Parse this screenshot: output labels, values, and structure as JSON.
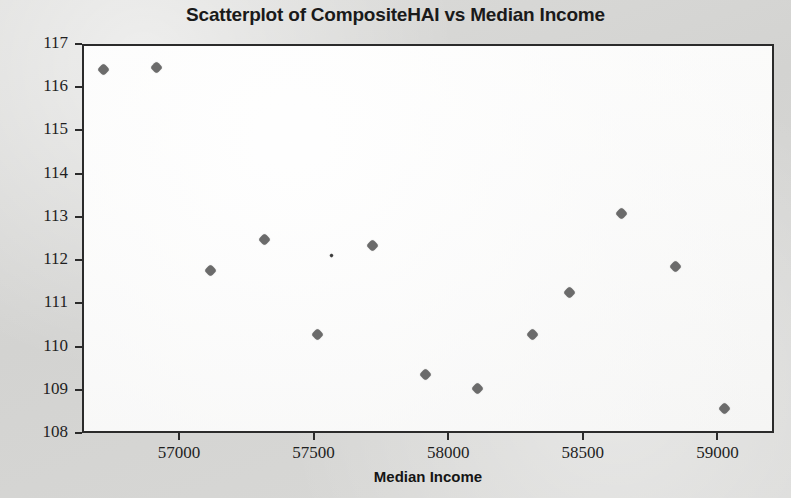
{
  "chart_data": {
    "type": "scatter",
    "title": "Scatterplot of CompositeHAI vs Median Income",
    "xlabel": "Median Income",
    "ylabel": "CompositeHAI",
    "xlim": [
      56640,
      59210
    ],
    "ylim": [
      108,
      117
    ],
    "xticks": [
      57000,
      57500,
      58000,
      58500,
      59000
    ],
    "xtick_labels": [
      "57000",
      "57500",
      "58000",
      "58500",
      "59000"
    ],
    "yticks": [
      108,
      109,
      110,
      111,
      112,
      113,
      114,
      115,
      116,
      117
    ],
    "ytick_labels": [
      "108",
      "109",
      "110",
      "111",
      "112",
      "113",
      "114",
      "115",
      "116",
      "117"
    ],
    "grid": false,
    "legend": null,
    "marker_color": "#6b6b6b",
    "points": [
      {
        "x": 56714,
        "y": 116.45
      },
      {
        "x": 56909,
        "y": 116.51
      },
      {
        "x": 57110,
        "y": 111.8
      },
      {
        "x": 57309,
        "y": 112.53
      },
      {
        "x": 57509,
        "y": 110.33
      },
      {
        "x": 57560,
        "y": 112.15,
        "size": "tiny"
      },
      {
        "x": 57711,
        "y": 112.39
      },
      {
        "x": 57908,
        "y": 109.4
      },
      {
        "x": 58103,
        "y": 109.08
      },
      {
        "x": 58306,
        "y": 110.33
      },
      {
        "x": 58444,
        "y": 111.3
      },
      {
        "x": 58636,
        "y": 113.13
      },
      {
        "x": 58837,
        "y": 111.89
      },
      {
        "x": 59020,
        "y": 108.62
      }
    ]
  },
  "colors": {
    "marker": "#6b6b6b",
    "frame": "#2b2b2b",
    "page_background": "#d6d6d4",
    "plot_background": "#fafaf9",
    "text": "#1a1a1a"
  }
}
